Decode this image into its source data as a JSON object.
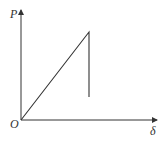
{
  "diagram": {
    "type": "load-displacement graph",
    "y_axis_label": "P",
    "x_axis_label": "δ",
    "origin_label": "O",
    "line_color": "#333333",
    "origin": [
      21,
      120
    ],
    "y_axis_end": [
      21,
      9
    ],
    "x_axis_end": [
      158,
      120
    ],
    "curve_points": [
      [
        21,
        120
      ],
      [
        89,
        32
      ],
      [
        89,
        97
      ]
    ]
  }
}
